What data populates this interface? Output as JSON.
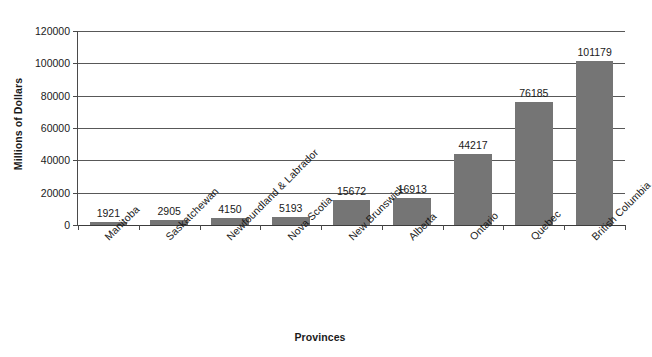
{
  "chart_data": {
    "type": "bar",
    "title": "",
    "xlabel": "Provinces",
    "ylabel": "Millions of Dollars",
    "categories": [
      "Manitoba",
      "Saskatchewan",
      "Newfoundland & Labrador",
      "Nova Scotia",
      "New Brunswick",
      "Alberta",
      "Ontario",
      "Quebec",
      "British Columbia"
    ],
    "values": [
      1921,
      2905,
      4150,
      5193,
      15672,
      16913,
      44217,
      76185,
      101179
    ],
    "value_labels": [
      "1921",
      "2905",
      "4150",
      "5193",
      "15672",
      "16913",
      "44217",
      "76185",
      "101179"
    ],
    "ylim": [
      0,
      120000
    ],
    "ytick_labels": [
      "0",
      "20000",
      "40000",
      "60000",
      "80000",
      "100000",
      "120000"
    ],
    "ytick_values": [
      0,
      20000,
      40000,
      60000,
      80000,
      100000,
      120000
    ],
    "grid": "horizontal",
    "legend": "none",
    "bar_color": "#757575",
    "grid_color": "#585858",
    "axis_color": "#4a4a4a",
    "background": "#ffffff",
    "label_rotation": -45
  }
}
